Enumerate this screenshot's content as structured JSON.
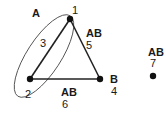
{
  "diagram": {
    "type": "graph",
    "colors": {
      "node": "#111111",
      "edge": "#222222",
      "ellipse": "#555555",
      "text": "#1a1a1a"
    },
    "nodes": [
      {
        "id": "1",
        "x": 70,
        "y": 19,
        "id_label": "1",
        "group_label": ""
      },
      {
        "id": "2",
        "x": 30,
        "y": 79,
        "id_label": "2",
        "group_label": ""
      },
      {
        "id": "4",
        "x": 100,
        "y": 79,
        "id_label": "4",
        "group_label": "B"
      },
      {
        "id": "7",
        "x": 153,
        "y": 76,
        "id_label": "7",
        "group_label": "AB"
      }
    ],
    "edges": [
      {
        "id": "3",
        "from": "1",
        "to": "2",
        "id_label": "3",
        "group_label": ""
      },
      {
        "id": "5",
        "from": "1",
        "to": "4",
        "id_label": "5",
        "group_label": "AB"
      },
      {
        "id": "6",
        "from": "2",
        "to": "4",
        "id_label": "6",
        "group_label": "AB"
      }
    ],
    "hyperedge": {
      "label": "A",
      "contains": [
        "1",
        "2",
        "3"
      ]
    }
  }
}
